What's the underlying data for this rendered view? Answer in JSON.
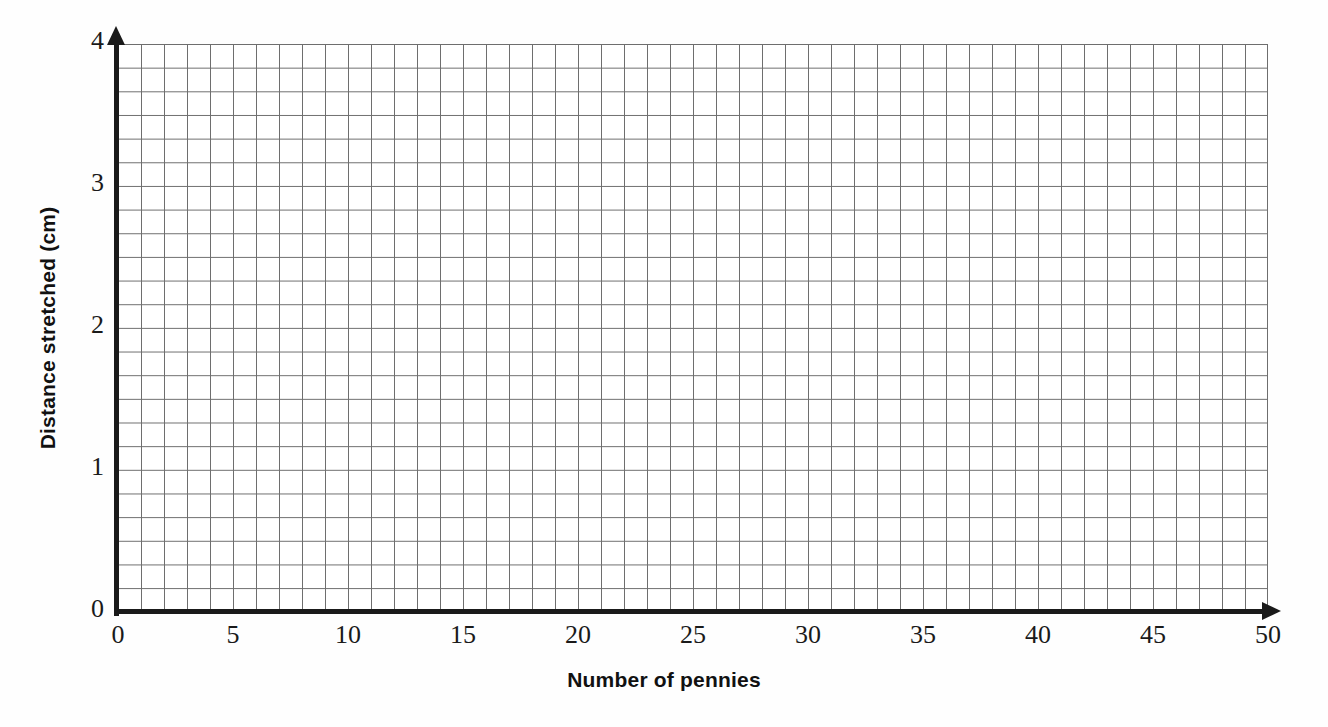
{
  "chart_data": {
    "type": "line",
    "title": "",
    "subtitle": "",
    "xlabel": "Number of pennies",
    "ylabel": "Distance stretched (cm)",
    "xlim": [
      0,
      50
    ],
    "ylim": [
      0,
      4
    ],
    "x_major_ticks": [
      0,
      5,
      10,
      15,
      20,
      25,
      30,
      35,
      40,
      45,
      50
    ],
    "y_major_ticks": [
      0,
      1,
      2,
      3,
      4
    ],
    "x_tick_labels": [
      "0",
      "5",
      "10",
      "15",
      "20",
      "25",
      "30",
      "35",
      "40",
      "45",
      "50"
    ],
    "y_tick_labels": [
      "0",
      "1",
      "2",
      "3",
      "4"
    ],
    "x_grid_step": 1,
    "y_grid_step": 0.1666667,
    "x_grid_columns": 50,
    "y_grid_rows": 24,
    "grid": true,
    "legend": null,
    "series": [],
    "values": [],
    "categories": [],
    "annotations": []
  },
  "axes": {
    "x": {
      "label": "Number of pennies",
      "ticks": [
        "0",
        "5",
        "10",
        "15",
        "20",
        "25",
        "30",
        "35",
        "40",
        "45",
        "50"
      ],
      "arrow": true
    },
    "y": {
      "label": "Distance stretched (cm)",
      "ticks": [
        "0",
        "1",
        "2",
        "3",
        "4"
      ],
      "arrow": true
    }
  },
  "colors": {
    "background": "#fefefe",
    "plot_background": "#ffffff",
    "grid_line": "#6e6e6e",
    "axis_line": "#1a1a1a",
    "text": "#111111"
  }
}
